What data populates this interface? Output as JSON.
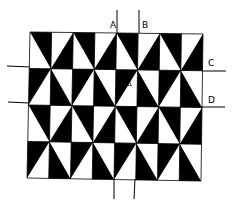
{
  "diagram": {
    "colors": {
      "fill": "#000000",
      "background": "#ffffff",
      "line": "#000000"
    },
    "grid": {
      "corners": {
        "tl": [
          30,
          32
        ],
        "tr": [
          203,
          34
        ],
        "bl": [
          27,
          178
        ],
        "br": [
          201,
          181
        ]
      },
      "cols": 8,
      "rows": 4,
      "row_patterns": {
        "odd_row": [
          {
            "diag": "\\",
            "black": "TR"
          },
          {
            "diag": "/",
            "black": "BR"
          }
        ],
        "even_row": [
          {
            "diag": "/",
            "black": "TL"
          },
          {
            "diag": "\\",
            "black": "BL"
          }
        ]
      }
    },
    "lines": [
      {
        "id": "A",
        "x1": 117,
        "y1": 10,
        "x2": 117,
        "y2": 33
      },
      {
        "id": "B",
        "x1": 139,
        "y1": 10,
        "x2": 139,
        "y2": 33
      },
      {
        "id": "C",
        "x1": 202,
        "y1": 71,
        "x2": 226,
        "y2": 71
      },
      {
        "id": "D",
        "x1": 201,
        "y1": 107,
        "x2": 225,
        "y2": 107
      },
      {
        "id": "left-upper",
        "x1": 7,
        "y1": 66,
        "x2": 30,
        "y2": 67
      },
      {
        "id": "left-lower",
        "x1": 8,
        "y1": 102,
        "x2": 29,
        "y2": 103
      },
      {
        "id": "bottom-left",
        "x1": 114,
        "y1": 179,
        "x2": 114,
        "y2": 199
      },
      {
        "id": "bottom-right",
        "x1": 135,
        "y1": 179,
        "x2": 134,
        "y2": 199
      }
    ],
    "labels": [
      {
        "text": "A",
        "x": 110,
        "y": 21
      },
      {
        "text": "B",
        "x": 142,
        "y": 21
      },
      {
        "text": "C",
        "x": 208,
        "y": 59
      },
      {
        "text": "D",
        "x": 208,
        "y": 96
      }
    ],
    "marker": {
      "text": "Δ",
      "x": 127,
      "y": 81
    }
  }
}
